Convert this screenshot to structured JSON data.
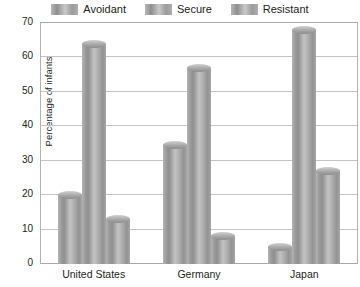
{
  "legend": {
    "position": "top",
    "items": [
      {
        "label": "Avoidant",
        "swatch_name": "legend-swatch-avoidant"
      },
      {
        "label": "Secure",
        "swatch_name": "legend-swatch-secure"
      },
      {
        "label": "Resistant",
        "swatch_name": "legend-swatch-resistant"
      }
    ]
  },
  "axes": {
    "ylabel": "Percentage of infants",
    "yticks": [
      "70",
      "60",
      "50",
      "40",
      "30",
      "20",
      "10",
      "0"
    ],
    "xlabel": ""
  },
  "chart_data": {
    "type": "bar",
    "title": "",
    "subtitle": "",
    "xlabel": "",
    "ylabel": "Percentage of infants",
    "ylim": [
      0,
      70
    ],
    "ytick_step": 10,
    "grid": true,
    "legend_position": "top",
    "grouping": "clustered",
    "categories": [
      "United States",
      "Germany",
      "Japan"
    ],
    "series": [
      {
        "name": "Avoidant",
        "values": [
          20,
          34.5,
          5
        ]
      },
      {
        "name": "Secure",
        "values": [
          64,
          57,
          68
        ]
      },
      {
        "name": "Resistant",
        "values": [
          13,
          8,
          27
        ]
      }
    ],
    "annotations": []
  },
  "colors": {
    "bar_light": "#c3c3c3",
    "bar_mid": "#a6a6a6",
    "bar_dark": "#8c8c8c",
    "gridline": "#c4c4c4",
    "axis_line": "#a9a9a9",
    "text": "#231f20",
    "background": "#ffffff"
  }
}
